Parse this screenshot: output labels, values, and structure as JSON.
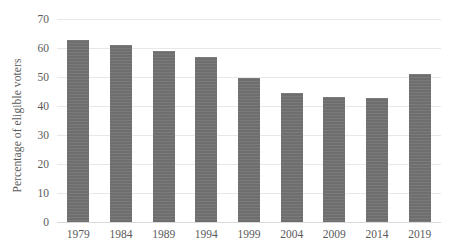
{
  "chart_data": {
    "type": "bar",
    "title": "",
    "subtitle": "",
    "xlabel": "",
    "ylabel": "Percentage of eligible voters",
    "categories": [
      "1979",
      "1984",
      "1989",
      "1994",
      "1999",
      "2004",
      "2009",
      "2014",
      "2019"
    ],
    "values": [
      62.8,
      61,
      58.8,
      56.8,
      49.8,
      44.6,
      43,
      42.8,
      51
    ],
    "ylim": [
      0,
      70
    ],
    "ytick_labels": [
      "0",
      "10",
      "20",
      "30",
      "40",
      "50",
      "60",
      "70"
    ],
    "ytick_values": [
      0,
      10,
      20,
      30,
      40,
      50,
      60,
      70
    ],
    "grid": true,
    "legend": null,
    "legend_position": "none",
    "bar_color": "#6e6e6e",
    "gridline_color": "#e8e8e8",
    "axis_text_color": "#5a5a5a",
    "background_color": "#ffffff"
  }
}
